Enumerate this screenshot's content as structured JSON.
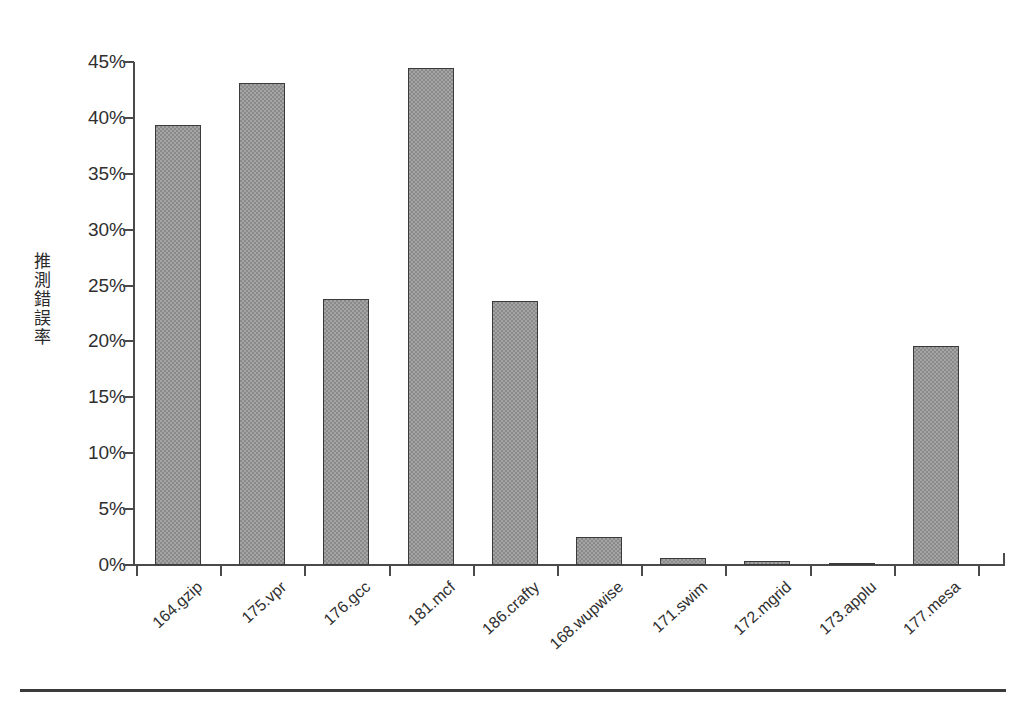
{
  "chart_data": {
    "type": "bar",
    "title": "",
    "xlabel": "",
    "ylabel": "推測錯誤率",
    "ylim": [
      0,
      45
    ],
    "ytick_labels": [
      "0%",
      "5%",
      "10%",
      "15%",
      "20%",
      "25%",
      "30%",
      "35%",
      "40%",
      "45%"
    ],
    "ytick_values": [
      0,
      5,
      10,
      15,
      20,
      25,
      30,
      35,
      40,
      45
    ],
    "grid": false,
    "legend": "none",
    "categories": [
      "164.gzip",
      "175.vpr",
      "176.gcc",
      "181.mcf",
      "186.crafty",
      "168.wupwise",
      "171.swim",
      "172.mgrid",
      "173.applu",
      "177.mesa"
    ],
    "values": [
      39.4,
      43.1,
      23.8,
      44.5,
      23.6,
      2.5,
      0.6,
      0.4,
      0.2,
      19.6
    ],
    "value_unit": "%",
    "bar_color": "#8a8a8a",
    "bar_border_color": "#3a3a3a",
    "axis_color": "#4a4a4a",
    "background": "#ffffff"
  }
}
